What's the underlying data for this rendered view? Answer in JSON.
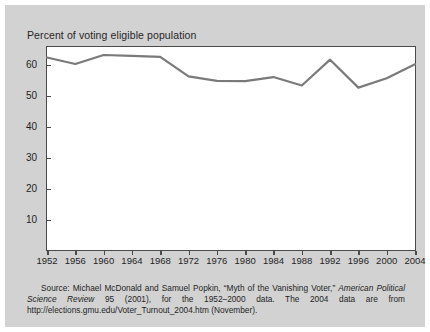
{
  "figure": {
    "title": "Percent of voting eligible population",
    "panel_color": "#d2d2d2",
    "plot_bg_color": "#ffffff",
    "line_color": "#7a7a7a",
    "axis_color": "#4a4a4a"
  },
  "source": {
    "label": "Source:",
    "text_1": " Michael McDonald and Samuel Popkin, “Myth of the Vanishing Voter,” ",
    "italic_1": "American Political Science Review",
    "text_2": " 95 (2001), for the 1952–2000 data. The 2004 data are from http://elections.gmu.edu/Voter_Turnout_2004.htm (November)."
  },
  "chart_data": {
    "type": "line",
    "title": "Percent of voting eligible population",
    "xlabel": "",
    "ylabel": "Percent of voting eligible population",
    "categories": [
      1952,
      1956,
      1960,
      1964,
      1968,
      1972,
      1976,
      1980,
      1984,
      1988,
      1992,
      1996,
      2000,
      2004
    ],
    "values": [
      62.3,
      60.2,
      63.1,
      62.8,
      62.5,
      56.2,
      54.8,
      54.7,
      56.0,
      53.3,
      61.6,
      52.6,
      55.6,
      60.1
    ],
    "xlim": [
      1952,
      2004
    ],
    "ylim": [
      0,
      66
    ],
    "yticks": [
      10,
      20,
      30,
      40,
      50,
      60
    ],
    "xticks": [
      1952,
      1956,
      1960,
      1964,
      1968,
      1972,
      1976,
      1980,
      1984,
      1988,
      1992,
      1996,
      2000,
      2004
    ],
    "grid": false,
    "legend": "none"
  }
}
